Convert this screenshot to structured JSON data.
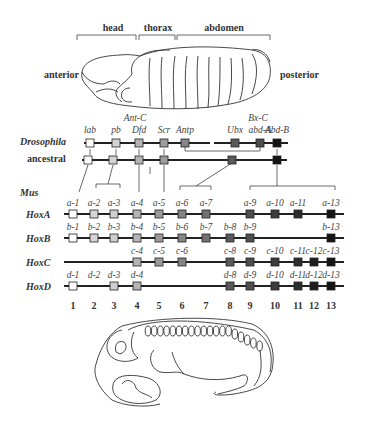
{
  "fly_embryo": {
    "regions": [
      "head",
      "thorax",
      "abdomen"
    ],
    "anterior_label": "anterior",
    "posterior_label": "posterior"
  },
  "complex_labels": {
    "ant_c": "Ant-C",
    "bx_c": "Bx-C"
  },
  "row_labels": {
    "drosophila": "Drosophila",
    "ancestral": "ancestral",
    "mus": "Mus",
    "hoxa": "HoxA",
    "hoxb": "HoxB",
    "hoxc": "HoxC",
    "hoxd": "HoxD"
  },
  "paralog_colors": {
    "1": "#ffffff",
    "2": "#d4d4d4",
    "3": "#cfcfcf",
    "4": "#b4b4b4",
    "5": "#9c9c9c",
    "6": "#848484",
    "7": "#727272",
    "8": "#5a5a5a",
    "9": "#4e4e4e",
    "10": "#3c3c3c",
    "11": "#2e2e2e",
    "12": "#1e1e1e",
    "13": "#141414"
  },
  "drosophila_genes": [
    {
      "name": "lab",
      "group": 1
    },
    {
      "name": "pb",
      "group": 2
    },
    {
      "name": "Dfd",
      "group": 4
    },
    {
      "name": "Scr",
      "group": 5
    },
    {
      "name": "Antp",
      "group": 6
    },
    {
      "name": "Ubx",
      "group": 8
    },
    {
      "name": "abd-A",
      "group": 9
    },
    {
      "name": "Abd-B",
      "group": 13
    }
  ],
  "ancestral_genes": [
    1,
    2,
    4,
    5,
    8,
    13
  ],
  "hox_clusters": [
    {
      "name": "HoxA",
      "genes": [
        {
          "label": "a-1",
          "group": 1
        },
        {
          "label": "a-2",
          "group": 2
        },
        {
          "label": "a-3",
          "group": 3
        },
        {
          "label": "a-4",
          "group": 4
        },
        {
          "label": "a-5",
          "group": 5
        },
        {
          "label": "a-6",
          "group": 6
        },
        {
          "label": "a-7",
          "group": 7
        },
        {
          "label": "a-9",
          "group": 9
        },
        {
          "label": "a-10",
          "group": 10
        },
        {
          "label": "a-11",
          "group": 11
        },
        {
          "label": "a-13",
          "group": 13
        }
      ]
    },
    {
      "name": "HoxB",
      "genes": [
        {
          "label": "b-1",
          "group": 1
        },
        {
          "label": "b-2",
          "group": 2
        },
        {
          "label": "b-3",
          "group": 3
        },
        {
          "label": "b-4",
          "group": 4
        },
        {
          "label": "b-5",
          "group": 5
        },
        {
          "label": "b-6",
          "group": 6
        },
        {
          "label": "b-7",
          "group": 7
        },
        {
          "label": "b-8",
          "group": 8
        },
        {
          "label": "b-9",
          "group": 9
        },
        {
          "label": "b-13",
          "group": 13
        }
      ]
    },
    {
      "name": "HoxC",
      "genes": [
        {
          "label": "c-4",
          "group": 4
        },
        {
          "label": "c-5",
          "group": 5
        },
        {
          "label": "c-6",
          "group": 6
        },
        {
          "label": "c-8",
          "group": 8
        },
        {
          "label": "c-9",
          "group": 9
        },
        {
          "label": "c-10",
          "group": 10
        },
        {
          "label": "c-11",
          "group": 11
        },
        {
          "label": "c-12",
          "group": 12
        },
        {
          "label": "c-13",
          "group": 13
        }
      ]
    },
    {
      "name": "HoxD",
      "genes": [
        {
          "label": "d-1",
          "group": 1
        },
        {
          "label": "d-2",
          "group": 2,
          "box": false
        },
        {
          "label": "d-3",
          "group": 3
        },
        {
          "label": "d-4",
          "group": 4
        },
        {
          "label": "d-8",
          "group": 8
        },
        {
          "label": "d-9",
          "group": 9
        },
        {
          "label": "d-10",
          "group": 10
        },
        {
          "label": "d-11",
          "group": 11
        },
        {
          "label": "d-12",
          "group": 12
        },
        {
          "label": "d-13",
          "group": 13
        }
      ]
    }
  ],
  "paralog_numbers": [
    "1",
    "2",
    "3",
    "4",
    "5",
    "6",
    "7",
    "8",
    "9",
    "10",
    "11",
    "12",
    "13"
  ]
}
